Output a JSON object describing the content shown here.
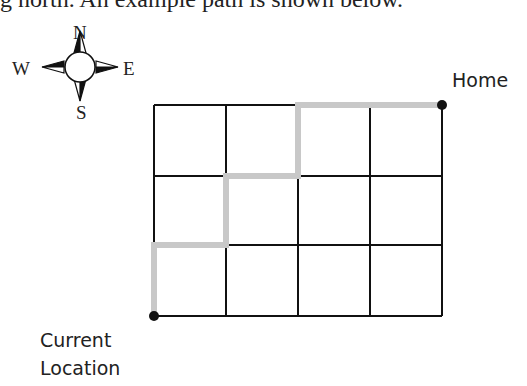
{
  "intro_text": "g north. An example path is shown below.",
  "compass": {
    "north": "N",
    "south": "S",
    "east": "E",
    "west": "W"
  },
  "labels": {
    "home": "Home",
    "start_line1": "Current",
    "start_line2": "Location"
  },
  "grid": {
    "columns": 4,
    "rows": 3,
    "x_lines": [
      154,
      226,
      298,
      370,
      442
    ],
    "y_lines": [
      105,
      176,
      245,
      316
    ],
    "line_color": "#111111"
  },
  "path": {
    "color": "#c8c8c8",
    "description": "From Current Location (bottom-left): north 1, east 1, north 1, east 1, north 1, east 2 to Home (top-right)",
    "points": [
      [
        154,
        316
      ],
      [
        154,
        245
      ],
      [
        226,
        245
      ],
      [
        226,
        176
      ],
      [
        298,
        176
      ],
      [
        298,
        105
      ],
      [
        442,
        105
      ]
    ]
  },
  "markers": {
    "start": [
      154,
      316
    ],
    "end": [
      442,
      105
    ]
  }
}
